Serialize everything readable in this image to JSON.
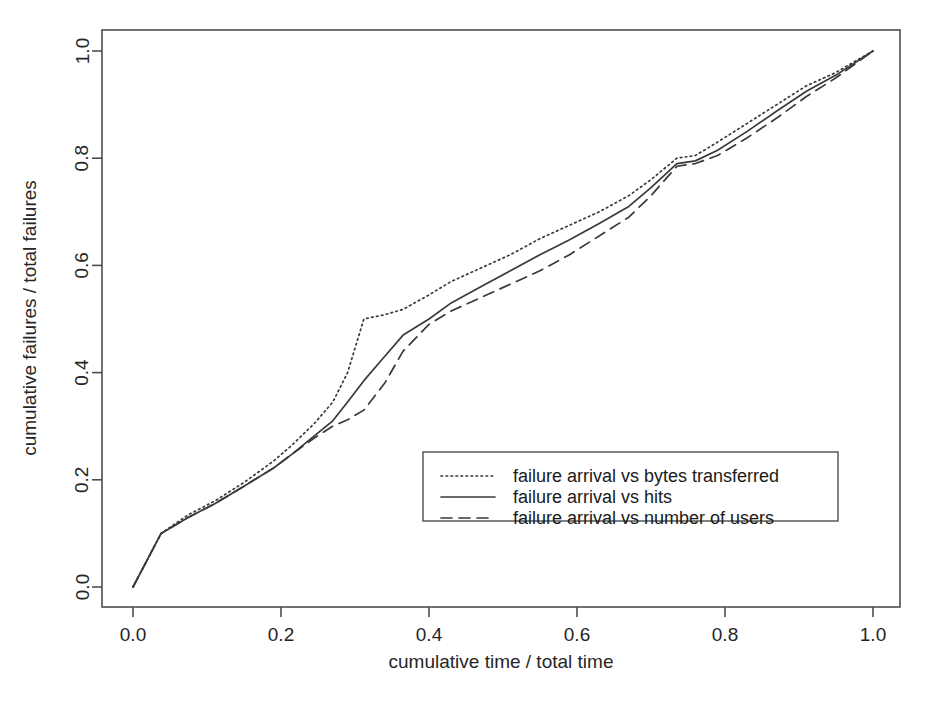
{
  "chart_data": {
    "type": "line",
    "title": "",
    "xlabel": "cumulative time / total time",
    "ylabel": "cumulative failures / total failures",
    "xlim": [
      0.0,
      1.0
    ],
    "ylim": [
      0.0,
      1.0
    ],
    "grid": false,
    "legend_position": "center-right-inside",
    "xticks": [
      "0.0",
      "0.2",
      "0.4",
      "0.6",
      "0.8",
      "1.0"
    ],
    "yticks": [
      "0.0",
      "0.2",
      "0.4",
      "0.6",
      "0.8",
      "1.0"
    ],
    "xtick_values": [
      0.0,
      0.2,
      0.4,
      0.6,
      0.8,
      1.0
    ],
    "ytick_values": [
      0.0,
      0.2,
      0.4,
      0.6,
      0.8,
      1.0
    ],
    "series": [
      {
        "name": "failure arrival vs bytes transferred",
        "style": "dotted",
        "color": "#3a3a3a",
        "x": [
          0.0,
          0.038,
          0.075,
          0.11,
          0.15,
          0.19,
          0.215,
          0.245,
          0.27,
          0.29,
          0.312,
          0.34,
          0.365,
          0.4,
          0.43,
          0.47,
          0.51,
          0.55,
          0.59,
          0.63,
          0.67,
          0.7,
          0.735,
          0.76,
          0.79,
          0.83,
          0.87,
          0.91,
          0.95,
          1.0
        ],
        "y": [
          0.0,
          0.1,
          0.135,
          0.16,
          0.195,
          0.235,
          0.265,
          0.305,
          0.345,
          0.4,
          0.5,
          0.508,
          0.518,
          0.545,
          0.57,
          0.595,
          0.62,
          0.65,
          0.675,
          0.7,
          0.73,
          0.76,
          0.8,
          0.805,
          0.83,
          0.865,
          0.9,
          0.935,
          0.96,
          1.0
        ]
      },
      {
        "name": "failure arrival vs hits",
        "style": "solid",
        "color": "#3a3a3a",
        "x": [
          0.0,
          0.038,
          0.075,
          0.11,
          0.15,
          0.19,
          0.215,
          0.245,
          0.27,
          0.29,
          0.312,
          0.34,
          0.365,
          0.4,
          0.43,
          0.47,
          0.51,
          0.55,
          0.59,
          0.63,
          0.67,
          0.7,
          0.735,
          0.76,
          0.79,
          0.83,
          0.87,
          0.91,
          0.95,
          1.0
        ],
        "y": [
          0.0,
          0.1,
          0.13,
          0.155,
          0.188,
          0.222,
          0.248,
          0.282,
          0.31,
          0.345,
          0.385,
          0.43,
          0.47,
          0.5,
          0.53,
          0.56,
          0.59,
          0.62,
          0.648,
          0.678,
          0.71,
          0.745,
          0.79,
          0.795,
          0.815,
          0.85,
          0.888,
          0.925,
          0.955,
          1.0
        ]
      },
      {
        "name": "failure arrival vs number of users",
        "style": "dashed",
        "color": "#3a3a3a",
        "x": [
          0.0,
          0.038,
          0.075,
          0.11,
          0.15,
          0.19,
          0.215,
          0.245,
          0.27,
          0.29,
          0.312,
          0.34,
          0.365,
          0.4,
          0.43,
          0.47,
          0.51,
          0.55,
          0.59,
          0.63,
          0.67,
          0.7,
          0.735,
          0.76,
          0.79,
          0.83,
          0.87,
          0.91,
          0.95,
          1.0
        ],
        "y": [
          0.0,
          0.1,
          0.13,
          0.155,
          0.188,
          0.222,
          0.248,
          0.278,
          0.3,
          0.312,
          0.33,
          0.38,
          0.44,
          0.49,
          0.515,
          0.54,
          0.565,
          0.59,
          0.62,
          0.655,
          0.69,
          0.73,
          0.785,
          0.79,
          0.805,
          0.838,
          0.875,
          0.915,
          0.95,
          1.0
        ]
      }
    ]
  },
  "axes": {
    "x_label": "cumulative time / total time",
    "y_label": "cumulative failures / total failures",
    "x_tick_labels": [
      "0.0",
      "0.2",
      "0.4",
      "0.6",
      "0.8",
      "1.0"
    ],
    "y_tick_labels": [
      "0.0",
      "0.2",
      "0.4",
      "0.6",
      "0.8",
      "1.0"
    ]
  },
  "legend": {
    "entries": [
      {
        "label": "failure arrival vs bytes transferred",
        "style": "dotted"
      },
      {
        "label": "failure arrival vs hits",
        "style": "solid"
      },
      {
        "label": "failure arrival vs number of users",
        "style": "dashed"
      }
    ]
  },
  "colors": {
    "background": "#ffffff",
    "axis": "#4d4d4d",
    "text": "#262626",
    "series": "#3a3a3a"
  }
}
